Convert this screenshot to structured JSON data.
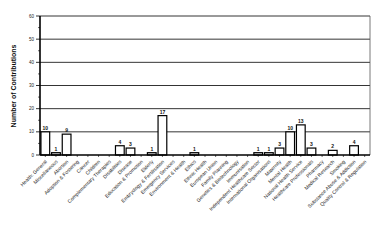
{
  "chart_data": {
    "type": "bar",
    "title": "",
    "xlabel": "",
    "ylabel": "Number of Contributions",
    "ylim": [
      0,
      60
    ],
    "yticks": [
      0,
      10,
      20,
      30,
      40,
      50,
      60
    ],
    "grid": true,
    "legend": "none",
    "categories": [
      "Health: General",
      "Miscellaneous",
      "Abortion",
      "Adoption & Fostering",
      "Cancer",
      "Children",
      "Complementary Therapies",
      "Disabilities",
      "Disease",
      "Education & Promotion",
      "Elderly",
      "Embryology & Fertilisation",
      "Emergency Services",
      "Environment & Health",
      "Ethics",
      "Ethnic Health",
      "European Union",
      "Family Planning",
      "Genetics & Biotechnology",
      "Immunisation",
      "Independent Healthcare Sector",
      "International Organisations",
      "Maternity",
      "Mental Health",
      "National Health Service",
      "Healthcare Professionals",
      "Pharmacy",
      "Medical Research",
      "Smoking",
      "Substance Abuse & Addiction",
      "Quality Control & Regulation"
    ],
    "values": [
      10,
      1,
      9,
      0,
      0,
      0,
      0,
      4,
      3,
      0,
      1,
      17,
      0,
      0,
      1,
      0,
      0,
      0,
      0,
      0,
      1,
      1,
      3,
      10,
      13,
      3,
      0,
      2,
      0,
      4,
      0
    ],
    "bar_fill": "#ffffff",
    "bar_stroke": "#000000",
    "small_bar_fill": "#d9d9d9"
  }
}
